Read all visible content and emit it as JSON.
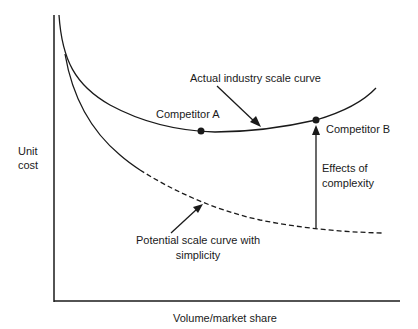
{
  "diagram": {
    "y_axis_label_line1": "Unit",
    "y_axis_label_line2": "cost",
    "x_axis_label": "Volume/market share",
    "actual_curve_label": "Actual industry scale curve",
    "competitor_a_label": "Competitor A",
    "competitor_b_label": "Competitor B",
    "effects_label_line1": "Effects of",
    "effects_label_line2": "complexity",
    "potential_curve_label_line1": "Potential scale curve with",
    "potential_curve_label_line2": "simplicity",
    "colors": {
      "line": "#1a1a1a",
      "background": "#ffffff"
    }
  }
}
